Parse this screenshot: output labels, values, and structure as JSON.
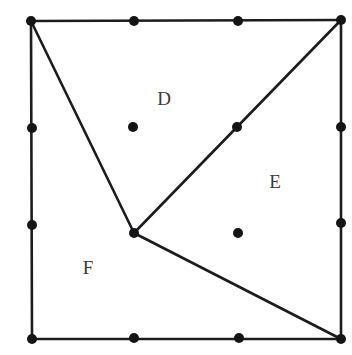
{
  "figure": {
    "width": 352,
    "height": 355,
    "background_color": "#ffffff",
    "stroke_color": "#1c1c1e",
    "dot_color": "#141416",
    "label_color": "#3a3a3c",
    "stroke_width": 2.6,
    "dot_radius": 5.0
  },
  "chart_data": {
    "type": "diagram",
    "xlabel": "",
    "ylabel": "",
    "xlim": [
      0,
      352
    ],
    "ylim": [
      0,
      355
    ],
    "grid": false,
    "legend": "none",
    "vertices": [
      {
        "id": "A",
        "name": "top-left-corner",
        "x": 31,
        "y": 21
      },
      {
        "id": "B",
        "name": "top-right-corner",
        "x": 341,
        "y": 20
      },
      {
        "id": "C",
        "name": "bottom-right-corner",
        "x": 341,
        "y": 339
      },
      {
        "id": "G",
        "name": "bottom-left-corner",
        "x": 32,
        "y": 339
      },
      {
        "id": "P",
        "name": "interior-junction",
        "x": 134,
        "y": 233
      }
    ],
    "edges": [
      {
        "name": "top-edge",
        "from": "A",
        "to": "B"
      },
      {
        "name": "right-edge",
        "from": "B",
        "to": "C"
      },
      {
        "name": "bottom-edge",
        "from": "C",
        "to": "G"
      },
      {
        "name": "left-edge",
        "from": "G",
        "to": "A"
      },
      {
        "name": "cut-topleft-to-junction",
        "from": "A",
        "to": "P"
      },
      {
        "name": "cut-junction-to-topright",
        "from": "P",
        "to": "B"
      },
      {
        "name": "cut-junction-to-bottomright",
        "from": "P",
        "to": "C"
      }
    ],
    "points": [
      {
        "name": "vertex-dot-top-left",
        "x": 31,
        "y": 21,
        "on": "corner"
      },
      {
        "name": "vertex-dot-top-right",
        "x": 341,
        "y": 20,
        "on": "corner"
      },
      {
        "name": "vertex-dot-bottom-right",
        "x": 341,
        "y": 339,
        "on": "corner"
      },
      {
        "name": "vertex-dot-bottom-left",
        "x": 32,
        "y": 339,
        "on": "corner"
      },
      {
        "name": "edge-dot-top-left-mid",
        "x": 134,
        "y": 21,
        "on": "top-edge"
      },
      {
        "name": "edge-dot-top-right-mid",
        "x": 238,
        "y": 21,
        "on": "top-edge"
      },
      {
        "name": "edge-dot-bottom-left-mid",
        "x": 134,
        "y": 338,
        "on": "bottom-edge"
      },
      {
        "name": "edge-dot-bottom-right-mid",
        "x": 239,
        "y": 338,
        "on": "bottom-edge"
      },
      {
        "name": "edge-dot-left-upper",
        "x": 32,
        "y": 128,
        "on": "left-edge"
      },
      {
        "name": "edge-dot-left-lower",
        "x": 32,
        "y": 225,
        "on": "left-edge"
      },
      {
        "name": "edge-dot-right-upper",
        "x": 341,
        "y": 127,
        "on": "right-edge"
      },
      {
        "name": "edge-dot-right-lower",
        "x": 341,
        "y": 223,
        "on": "right-edge"
      },
      {
        "name": "interior-dot-region-d",
        "x": 133,
        "y": 127,
        "on": "region-D"
      },
      {
        "name": "diagonal-dot-upper",
        "x": 237,
        "y": 127,
        "on": "cut-junction-to-topright"
      },
      {
        "name": "interior-dot-region-e",
        "x": 238,
        "y": 233,
        "on": "region-E"
      },
      {
        "name": "junction-dot-center",
        "x": 134,
        "y": 233,
        "on": "interior-junction"
      }
    ],
    "labels": [
      {
        "name": "region-label-d",
        "text": "D",
        "x": 164,
        "y": 101
      },
      {
        "name": "region-label-e",
        "text": "E",
        "x": 275,
        "y": 184
      },
      {
        "name": "region-label-f",
        "text": "F",
        "x": 88,
        "y": 270
      }
    ]
  }
}
